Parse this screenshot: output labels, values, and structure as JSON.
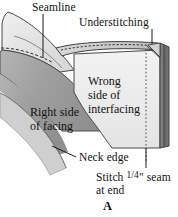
{
  "figure": {
    "caption": "A",
    "type": "sewing-construction-diagram"
  },
  "labels": {
    "seamline": "Seamline",
    "understitching": "Understitching",
    "neck_edge": "Neck edge",
    "stitch_note_line1": "Stitch",
    "stitch_note_fraction": "1/4",
    "stitch_note_line1_tail": "\" seam",
    "stitch_note_line2": "at end"
  },
  "area_labels": {
    "right_side_of_facing_line1": "Right side",
    "right_side_of_facing_line2": "of facing",
    "wrong_side_of_interfacing_line1": "Wrong",
    "wrong_side_of_interfacing_line2": "side of",
    "wrong_side_of_interfacing_line3": "interfacing"
  },
  "colors": {
    "facing_dark_gray": "#9d9d9d",
    "facing_light_gray": "#e2e2e2",
    "interfacing_light": "#ececec",
    "fold_edge_dark": "#6f6f6f",
    "outline": "#3a3a3a",
    "text": "#111111",
    "background": "#ffffff"
  },
  "leader_lines": [
    {
      "name": "seamline-leader",
      "from": "Seamline label",
      "to": "dashed seam on facing"
    },
    {
      "name": "understitching-leader",
      "from": "Understitching label",
      "to": "top-right stitched edge"
    },
    {
      "name": "neck-edge-leader",
      "from": "Neck edge label",
      "to": "lower curved edge of facing"
    },
    {
      "name": "stitch-seam-leader",
      "from": "Stitch 1/4\" seam at end label",
      "to": "vertical dotted line at right end"
    }
  ]
}
